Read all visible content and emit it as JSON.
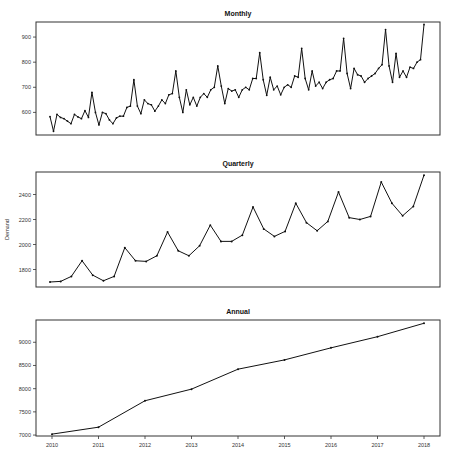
{
  "chart_data": [
    {
      "type": "line",
      "title": "Monthly",
      "xlabel": "",
      "ylabel": "",
      "yticks": [
        600,
        700,
        800,
        900
      ],
      "ylim": [
        510,
        960
      ],
      "grid": false,
      "x": "monthly index 2010-01 .. 2018-12",
      "values": [
        583,
        525,
        592,
        580,
        575,
        565,
        555,
        592,
        582,
        575,
        607,
        580,
        680,
        600,
        550,
        600,
        595,
        570,
        555,
        578,
        585,
        585,
        620,
        625,
        730,
        625,
        595,
        650,
        635,
        630,
        605,
        625,
        650,
        635,
        670,
        675,
        765,
        660,
        600,
        690,
        630,
        660,
        625,
        660,
        675,
        660,
        690,
        700,
        785,
        705,
        635,
        695,
        685,
        690,
        660,
        690,
        700,
        690,
        735,
        735,
        838,
        730,
        668,
        740,
        690,
        705,
        670,
        700,
        710,
        700,
        745,
        740,
        855,
        735,
        690,
        765,
        705,
        720,
        695,
        720,
        730,
        735,
        765,
        765,
        895,
        755,
        695,
        775,
        750,
        745,
        720,
        735,
        745,
        755,
        775,
        790,
        930,
        785,
        720,
        835,
        740,
        765,
        740,
        780,
        775,
        800,
        810,
        950
      ]
    },
    {
      "type": "line",
      "title": "Quarterly",
      "xlabel": "",
      "ylabel": "Demand",
      "yticks": [
        1800,
        2000,
        2200,
        2400
      ],
      "ylim": [
        1660,
        2580
      ],
      "grid": false,
      "x": "quarterly index 2010Q1 .. 2018Q4",
      "values": [
        1700,
        1705,
        1745,
        1870,
        1755,
        1710,
        1745,
        1975,
        1870,
        1865,
        1910,
        2100,
        1950,
        1910,
        1990,
        2155,
        2025,
        2025,
        2075,
        2300,
        2125,
        2065,
        2105,
        2330,
        2175,
        2110,
        2185,
        2420,
        2215,
        2200,
        2225,
        2500,
        2330,
        2230,
        2305,
        2555
      ]
    },
    {
      "type": "line",
      "title": "Annual",
      "xlabel": "",
      "ylabel": "",
      "categories": [
        "2010",
        "2011",
        "2012",
        "2013",
        "2014",
        "2015",
        "2016",
        "2017",
        "2018"
      ],
      "yticks": [
        7000,
        7500,
        8000,
        8500,
        9000
      ],
      "ylim": [
        6980,
        9480
      ],
      "grid": false,
      "values": [
        7020,
        7170,
        7740,
        7990,
        8420,
        8620,
        8880,
        9120,
        9410
      ]
    }
  ],
  "panels": {
    "monthly": {
      "title": "Monthly"
    },
    "quarterly": {
      "title": "Quarterly",
      "ylabel": "Demand"
    },
    "annual": {
      "title": "Annual"
    }
  }
}
